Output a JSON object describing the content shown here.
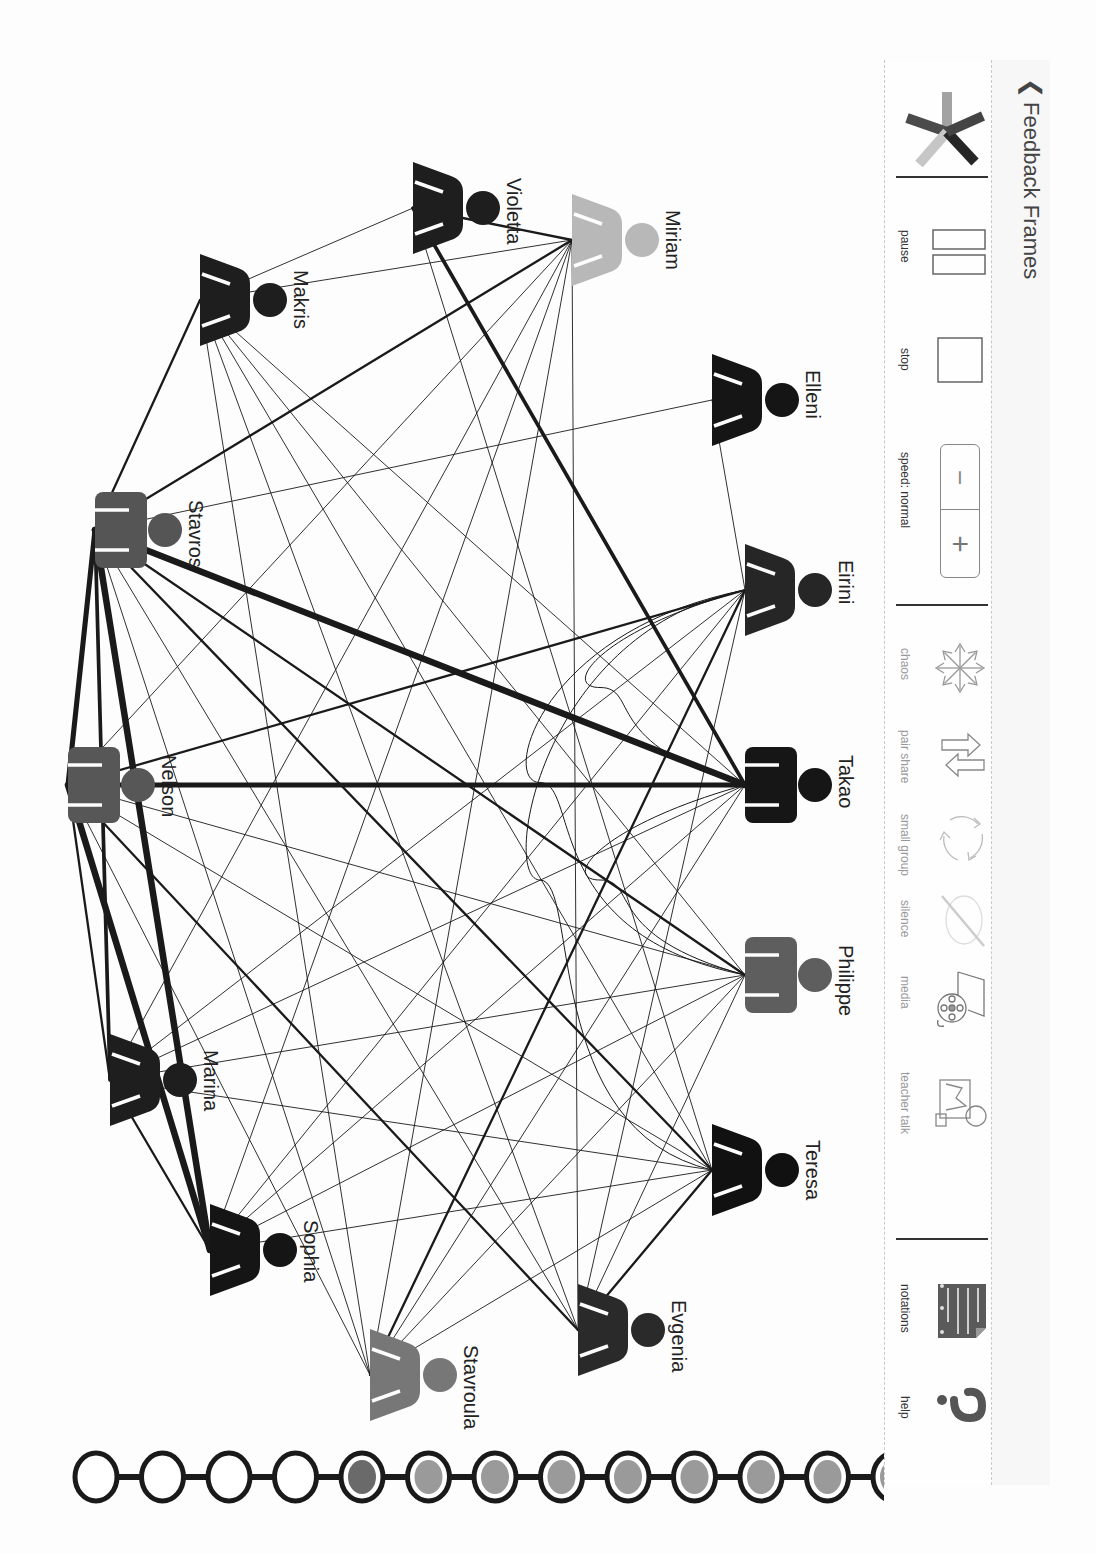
{
  "header": {
    "back_icon": "chevron-left-icon",
    "title": "Feedback Frames"
  },
  "toolbar": {
    "logo_icon": "pinwheel-logo-icon",
    "playback": [
      {
        "id": "pause",
        "label": "pause",
        "icon": "pause-icon"
      },
      {
        "id": "stop",
        "label": "stop",
        "icon": "stop-icon"
      },
      {
        "id": "speed",
        "label": "speed: normal",
        "icon": "speed-stepper-icon",
        "minus": "−",
        "plus": "+"
      }
    ],
    "modes": [
      {
        "id": "chaos",
        "label": "chaos",
        "icon": "chaos-arrows-icon"
      },
      {
        "id": "pair-share",
        "label": "pair share",
        "icon": "swap-arrows-icon"
      },
      {
        "id": "small-group",
        "label": "small group",
        "icon": "cycle-arrows-icon"
      },
      {
        "id": "silence",
        "label": "silence",
        "icon": "silence-icon"
      },
      {
        "id": "media",
        "label": "media",
        "icon": "film-reel-icon"
      },
      {
        "id": "teacher-talk",
        "label": "teacher talk",
        "icon": "teacher-board-icon"
      }
    ],
    "extras": [
      {
        "id": "notations",
        "label": "notations",
        "icon": "notepad-icon"
      },
      {
        "id": "help",
        "label": "help",
        "icon": "question-mark-icon"
      }
    ]
  },
  "graph": {
    "nodes": [
      {
        "id": "violetta",
        "name": "Violetta",
        "type": "dress",
        "color": "#1e1e1e",
        "x": 413,
        "y": 208
      },
      {
        "id": "miriam",
        "name": "Miriam",
        "type": "dress",
        "color": "#b8b8b8",
        "x": 572,
        "y": 240
      },
      {
        "id": "makris",
        "name": "Makris",
        "type": "dress",
        "color": "#1e1e1e",
        "x": 200,
        "y": 300
      },
      {
        "id": "elleni",
        "name": "Elleni",
        "type": "dress",
        "color": "#151515",
        "x": 712,
        "y": 400
      },
      {
        "id": "stavros",
        "name": "Stavros",
        "type": "shirt",
        "color": "#555555",
        "x": 95,
        "y": 530
      },
      {
        "id": "eirini",
        "name": "Eirini",
        "type": "dress",
        "color": "#262626",
        "x": 745,
        "y": 590
      },
      {
        "id": "takao",
        "name": "Takao",
        "type": "shirt",
        "color": "#161616",
        "x": 745,
        "y": 785
      },
      {
        "id": "nelson",
        "name": "Nelson",
        "type": "shirt",
        "color": "#575757",
        "x": 68,
        "y": 785
      },
      {
        "id": "philippe",
        "name": "Philippe",
        "type": "shirt",
        "color": "#5e5e5e",
        "x": 745,
        "y": 975
      },
      {
        "id": "marina",
        "name": "Marina",
        "type": "dress",
        "color": "#1e1e1e",
        "x": 110,
        "y": 1080
      },
      {
        "id": "teresa",
        "name": "Teresa",
        "type": "dress",
        "color": "#111111",
        "x": 712,
        "y": 1170
      },
      {
        "id": "sophia",
        "name": "Sophia",
        "type": "dress",
        "color": "#151515",
        "x": 210,
        "y": 1250
      },
      {
        "id": "evgenia",
        "name": "Evgenia",
        "type": "dress",
        "color": "#2a2a2a",
        "x": 578,
        "y": 1330
      },
      {
        "id": "stavroula",
        "name": "Stavroula",
        "type": "dress",
        "color": "#777777",
        "x": 370,
        "y": 1375
      }
    ],
    "edges": [
      [
        "violetta",
        "miriam",
        2
      ],
      [
        "violetta",
        "makris",
        1
      ],
      [
        "violetta",
        "takao",
        3
      ],
      [
        "violetta",
        "teresa",
        1
      ],
      [
        "miriam",
        "makris",
        1
      ],
      [
        "miriam",
        "stavros",
        2
      ],
      [
        "miriam",
        "nelson",
        1
      ],
      [
        "miriam",
        "marina",
        1
      ],
      [
        "miriam",
        "sophia",
        1
      ],
      [
        "miriam",
        "stavroula",
        1
      ],
      [
        "miriam",
        "evgenia",
        1
      ],
      [
        "makris",
        "stavros",
        2
      ],
      [
        "makris",
        "philippe",
        1
      ],
      [
        "makris",
        "teresa",
        1
      ],
      [
        "makris",
        "evgenia",
        1
      ],
      [
        "makris",
        "stavroula",
        1
      ],
      [
        "makris",
        "takao",
        1
      ],
      [
        "elleni",
        "stavros",
        1
      ],
      [
        "elleni",
        "eirini",
        1
      ],
      [
        "stavros",
        "takao",
        5
      ],
      [
        "stavros",
        "nelson",
        4
      ],
      [
        "stavros",
        "marina",
        3
      ],
      [
        "stavros",
        "sophia",
        5
      ],
      [
        "stavros",
        "philippe",
        2
      ],
      [
        "stavros",
        "teresa",
        2
      ],
      [
        "stavros",
        "evgenia",
        1
      ],
      [
        "stavros",
        "stavroula",
        1
      ],
      [
        "eirini",
        "nelson",
        2
      ],
      [
        "eirini",
        "marina",
        1
      ],
      [
        "eirini",
        "sophia",
        1
      ],
      [
        "eirini",
        "stavroula",
        2
      ],
      [
        "eirini",
        "evgenia",
        1
      ],
      [
        "takao",
        "nelson",
        4
      ],
      [
        "takao",
        "marina",
        1
      ],
      [
        "takao",
        "sophia",
        1
      ],
      [
        "takao",
        "stavroula",
        1
      ],
      [
        "nelson",
        "philippe",
        1
      ],
      [
        "nelson",
        "marina",
        2
      ],
      [
        "nelson",
        "sophia",
        5
      ],
      [
        "nelson",
        "teresa",
        1
      ],
      [
        "nelson",
        "evgenia",
        2
      ],
      [
        "nelson",
        "stavroula",
        1
      ],
      [
        "philippe",
        "stavroula",
        1
      ],
      [
        "philippe",
        "sophia",
        1
      ],
      [
        "philippe",
        "evgenia",
        1
      ],
      [
        "philippe",
        "marina",
        1
      ],
      [
        "marina",
        "sophia",
        2
      ],
      [
        "marina",
        "teresa",
        1
      ],
      [
        "teresa",
        "stavroula",
        1
      ],
      [
        "teresa",
        "evgenia",
        2
      ],
      [
        "teresa",
        "sophia",
        1
      ]
    ],
    "curved_edges": [
      [
        "eirini",
        "takao"
      ],
      [
        "takao",
        "philippe"
      ],
      [
        "eirini",
        "philippe"
      ],
      [
        "eirini",
        "teresa"
      ]
    ]
  },
  "timeline": {
    "frames": [
      {
        "state": "empty"
      },
      {
        "state": "empty"
      },
      {
        "state": "empty"
      },
      {
        "state": "empty"
      },
      {
        "state": "current"
      },
      {
        "state": "filled"
      },
      {
        "state": "filled"
      },
      {
        "state": "filled"
      },
      {
        "state": "filled"
      },
      {
        "state": "filled"
      },
      {
        "state": "filled"
      },
      {
        "state": "filled"
      },
      {
        "state": "filled"
      }
    ]
  },
  "colors": {
    "ink": "#1a1a1a",
    "frame_current": "#6a6a6a",
    "frame_filled": "#9a9a9a",
    "logo": [
      "#9c9c9c",
      "#4a4a4a",
      "#2a2a2a",
      "#c4c4c4",
      "#3a3a3a"
    ]
  }
}
